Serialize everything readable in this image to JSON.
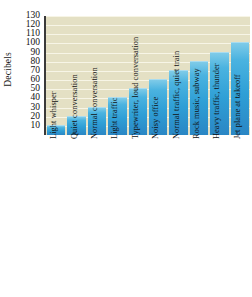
{
  "chart_data": {
    "type": "bar",
    "title": "",
    "xlabel": "",
    "ylabel": "Decibels",
    "ylim": [
      0,
      130
    ],
    "ytick_labels": [
      "130",
      "120",
      "110",
      "100",
      "90",
      "80",
      "70",
      "60",
      "50",
      "40",
      "30",
      "20",
      "10"
    ],
    "ytick_values": [
      130,
      120,
      110,
      100,
      90,
      80,
      70,
      60,
      50,
      40,
      30,
      20,
      10
    ],
    "grid": true,
    "legend": null,
    "bar_color": "#2f9fd6",
    "plot_background": "#e4e0c4",
    "categories": [
      "Light whisper",
      "Quiet conversation",
      "Normal conversation",
      "Light traffic",
      "Typewriter, loud conversation",
      "Noisy office",
      "Normal traffic, quiet train",
      "Rock music, subway",
      "Heavy traffic, thunder",
      "Jet plane at takeoff"
    ],
    "values": [
      10,
      20,
      30,
      40,
      50,
      60,
      70,
      80,
      90,
      100
    ]
  }
}
